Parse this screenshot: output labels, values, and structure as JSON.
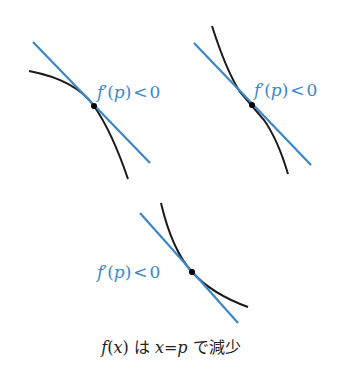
{
  "colors": {
    "tangent": "#3a87c8",
    "curve": "#1a1a1a",
    "point": "#000000",
    "label": "#3a87c8",
    "caption": "#222222"
  },
  "panels": [
    {
      "id": "concave-down",
      "label": {
        "f": "f",
        "prime": "′",
        "open": "(",
        "p": "p",
        "close": ")",
        "lt": "<",
        "zero": "0"
      },
      "tangent": {
        "x1": 33,
        "y1": 42,
        "x2": 150,
        "y2": 163
      },
      "point": {
        "x": 94,
        "y": 106
      }
    },
    {
      "id": "inflection",
      "label": {
        "f": "f",
        "prime": "′",
        "open": "(",
        "p": "p",
        "close": ")",
        "lt": "<",
        "zero": "0"
      },
      "tangent": {
        "x1": 194,
        "y1": 43,
        "x2": 311,
        "y2": 165
      },
      "point": {
        "x": 252,
        "y": 105
      }
    },
    {
      "id": "concave-up",
      "label": {
        "f": "f",
        "prime": "′",
        "open": "(",
        "p": "p",
        "close": ")",
        "lt": "<",
        "zero": "0"
      },
      "tangent": {
        "x1": 140,
        "y1": 213,
        "x2": 238,
        "y2": 323
      },
      "point": {
        "x": 192,
        "y": 272
      }
    }
  ],
  "caption": {
    "f": "f",
    "paren_open": "(",
    "x": "x",
    "paren_close": ")",
    "wa": " は ",
    "x2": "x",
    "eq": "=",
    "p": "p",
    "rest": " で減少"
  }
}
